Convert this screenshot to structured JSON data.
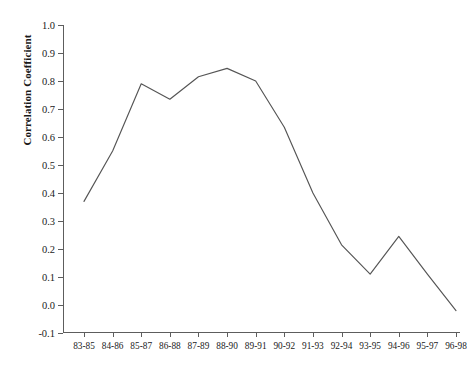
{
  "chart_data": {
    "type": "line",
    "title": "",
    "xlabel": "",
    "ylabel": "Correlation Coefficient",
    "categories": [
      "83-85",
      "84-86",
      "85-87",
      "86-88",
      "87-89",
      "88-90",
      "89-91",
      "90-92",
      "91-93",
      "92-94",
      "93-95",
      "94-96",
      "95-97",
      "96-98"
    ],
    "values": [
      0.37,
      0.55,
      0.79,
      0.735,
      0.815,
      0.845,
      0.8,
      0.635,
      0.4,
      0.215,
      0.11,
      0.245,
      0.11,
      -0.02
    ],
    "ylim": [
      -0.1,
      1.0
    ],
    "ytick_labels": [
      "1.0",
      "0.9",
      "0.8",
      "0.7",
      "0.6",
      "0.5",
      "0.4",
      "0.3",
      "0.2",
      "0.1",
      "0.0",
      "-0.1"
    ],
    "ytick_values": [
      1.0,
      0.9,
      0.8,
      0.7,
      0.6,
      0.5,
      0.4,
      0.3,
      0.2,
      0.1,
      0.0,
      -0.1
    ],
    "grid": false,
    "legend": null,
    "line_color": "#555555",
    "series": [
      {
        "name": "Correlation Coefficient",
        "values": [
          0.37,
          0.55,
          0.79,
          0.735,
          0.815,
          0.845,
          0.8,
          0.635,
          0.4,
          0.215,
          0.11,
          0.245,
          0.11,
          -0.02
        ]
      }
    ]
  }
}
